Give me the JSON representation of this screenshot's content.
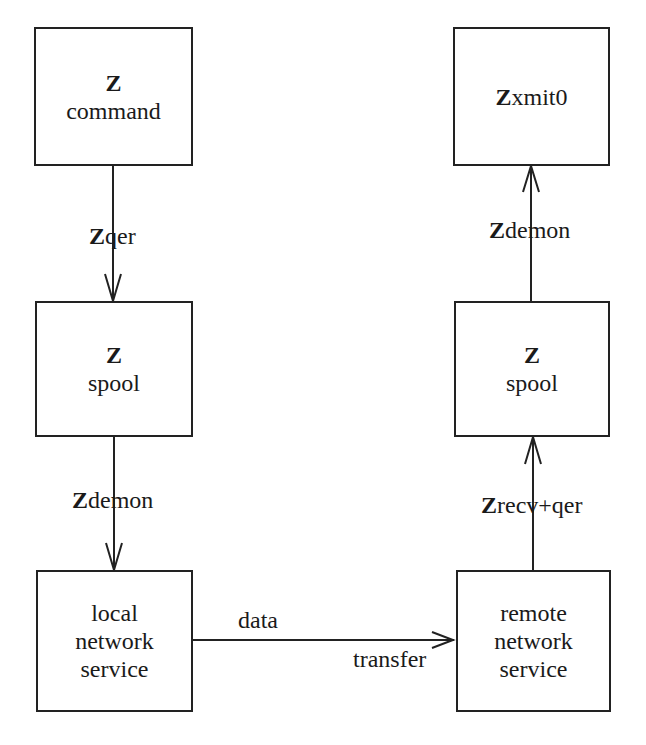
{
  "nodes": {
    "z_command": {
      "title": "Z",
      "subtitle": "command"
    },
    "zxmit0": {
      "title_bold": "Z",
      "title_rest": "xmit0"
    },
    "z_spool_local": {
      "title": "Z",
      "subtitle": "spool"
    },
    "z_spool_remote": {
      "title": "Z",
      "subtitle": "spool"
    },
    "local_network_service": {
      "lines": [
        "local",
        "network",
        "service"
      ]
    },
    "remote_network_service": {
      "lines": [
        "remote",
        "network",
        "service"
      ]
    }
  },
  "edges": {
    "zqer": {
      "bold": "Z",
      "rest": "qer",
      "from": "Z command",
      "to": "Z spool (local)"
    },
    "zdemon_local": {
      "bold": "Z",
      "rest": "demon",
      "from": "Z spool (local)",
      "to": "local network service"
    },
    "data_transfer": {
      "top": "data",
      "bottom": "transfer",
      "from": "local network service",
      "to": "remote network service"
    },
    "zrecv_qer": {
      "bold": "Z",
      "rest": "recv+qer",
      "from": "remote network service",
      "to": "Z spool (remote)"
    },
    "zdemon_remote": {
      "bold": "Z",
      "rest": "demon",
      "from": "Z spool (remote)",
      "to": "Zxmit0"
    }
  },
  "colors": {
    "stroke": "#222222",
    "background": "#ffffff",
    "text": "#1a1a1a"
  }
}
